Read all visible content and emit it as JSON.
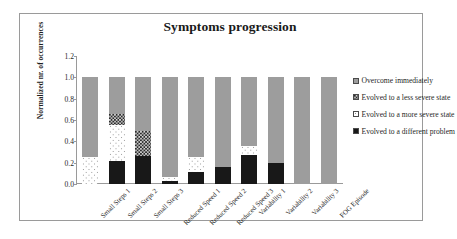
{
  "chart_data": {
    "type": "bar",
    "subtype": "stacked-bar",
    "title": "Symptoms progression",
    "xlabel": "",
    "ylabel": "Normalized nr. of occurrences",
    "ylim": [
      0,
      1.2
    ],
    "ytick_values": [
      0.0,
      0.2,
      0.4,
      0.6,
      0.8,
      1.0,
      1.2
    ],
    "ytick_labels": [
      "0.0",
      "0.2",
      "0.4",
      "0.6",
      "0.8",
      "1.0",
      "1.2"
    ],
    "grid": false,
    "legend_position": "right",
    "stack_order_bottom_to_top": [
      "Evolved to a different problem",
      "Evolved to a more severe state",
      "Evolved to a less severe state",
      "Overcome immediately"
    ],
    "categories": [
      "Small Steps 1",
      "Small Steps 2",
      "Small Steps 3",
      "Reduced Speed 1",
      "Reduced Speed 2",
      "Reduced Speed 3",
      "Variability 1",
      "Variability 2",
      "Variability 3",
      "FOG Episode"
    ],
    "series": [
      {
        "name": "Evolved to a different problem",
        "pattern": "solid-black",
        "color": "#181818",
        "values": [
          0.0,
          0.22,
          0.26,
          0.03,
          0.11,
          0.16,
          0.27,
          0.2,
          0.0,
          0.0
        ]
      },
      {
        "name": "Evolved to a more severe state",
        "pattern": "white-dotted",
        "color": "#ffffff",
        "values": [
          0.25,
          0.33,
          0.0,
          0.04,
          0.14,
          0.0,
          0.09,
          0.0,
          0.0,
          0.0
        ]
      },
      {
        "name": "Evolved to a less severe state",
        "pattern": "dark-checkered",
        "color": "#2b2b2b",
        "values": [
          0.0,
          0.11,
          0.24,
          0.0,
          0.0,
          0.0,
          0.0,
          0.0,
          0.0,
          0.0
        ]
      },
      {
        "name": "Overcome immediately",
        "pattern": "gray-dotted",
        "color": "#9d9d9d",
        "values": [
          0.75,
          0.34,
          0.5,
          0.93,
          0.75,
          0.84,
          0.64,
          0.8,
          1.0,
          1.0
        ]
      }
    ],
    "totals": [
      1.0,
      1.0,
      1.0,
      1.0,
      1.0,
      1.0,
      1.0,
      1.0,
      1.0,
      1.0
    ]
  },
  "legend": {
    "items": [
      {
        "label": "Overcome immediately",
        "pattern": "gray-dotted"
      },
      {
        "label": "Evolved to a less severe state",
        "pattern": "dark-checkered"
      },
      {
        "label": "Evolved to a more severe state",
        "pattern": "white-dotted"
      },
      {
        "label": "Evolved to a different problem",
        "pattern": "solid-black"
      }
    ]
  }
}
